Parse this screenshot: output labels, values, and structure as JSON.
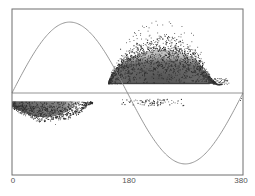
{
  "chart_data": {
    "type": "scatter",
    "title": "",
    "xlabel": "",
    "ylabel": "",
    "xlim": [
      0,
      380
    ],
    "ylim": [
      -1,
      1
    ],
    "grid": false,
    "legend": null,
    "x_ticks": [
      {
        "value": 0,
        "label": "0"
      },
      {
        "value": 180,
        "label": "180"
      },
      {
        "value": 380,
        "label": "380"
      }
    ],
    "reference_line": {
      "y": 0,
      "description": "horizontal zero line"
    },
    "series": [
      {
        "name": "sine reference curve",
        "kind": "line",
        "description": "one full sine period across x range, amplitude ~0.88 of half-height",
        "x": [
          0,
          47.5,
          95,
          142.5,
          190,
          237.5,
          285,
          332.5,
          380
        ],
        "y": [
          0,
          0.62,
          0.88,
          0.62,
          0,
          -0.62,
          -0.88,
          -0.62,
          0
        ],
        "color": "#8a8a8a"
      },
      {
        "name": "positive scatter cloud",
        "kind": "scatter",
        "description": "dense cloud above zero line, x ~ 160-340, base at y ~0.11, dense top ~0.6, sparse outliers up to ~0.85",
        "x_range": [
          158,
          345
        ],
        "base_y": 0.11,
        "dense_peak_y": 0.62,
        "outlier_peak_y": 0.86,
        "color": "#3a3a3a"
      },
      {
        "name": "negative scatter cloud",
        "kind": "scatter",
        "description": "cloud just below zero line, x ~ 0-130, top at y ~ -0.1, bottom ~ -0.3, outliers to ~ -0.4",
        "x_range": [
          0,
          132
        ],
        "top_y": -0.1,
        "bottom_y": -0.3,
        "color": "#3a3a3a"
      },
      {
        "name": "sparse band",
        "kind": "scatter",
        "description": "thin sparse band just below zero line, x ~ 180-280",
        "x_range": [
          180,
          285
        ],
        "y_range": [
          -0.07,
          -0.15
        ],
        "color": "#444444"
      }
    ]
  },
  "plot": {
    "frame": {
      "left": 12,
      "top": 9,
      "right": 243,
      "bottom": 175
    },
    "zero_line_y": 93,
    "colors": {
      "frame": "#6e6e6e",
      "zero_line": "#7a7a7a",
      "sine": "#8c8c8c",
      "cloud_dense": "#4e4e4e",
      "cloud_point": "#2e2e2e",
      "tick_text": "#555555"
    }
  },
  "axis": {
    "x_tick_labels": [
      "0",
      "180",
      "380"
    ]
  }
}
